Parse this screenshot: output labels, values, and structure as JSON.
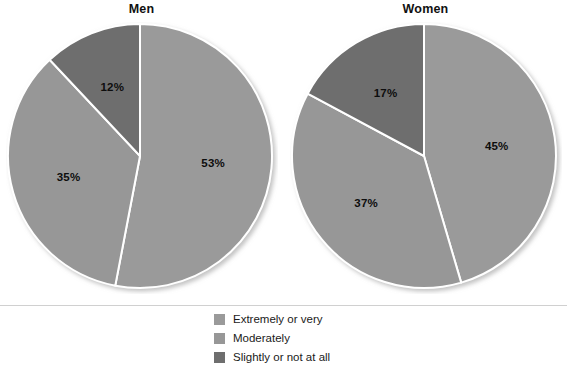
{
  "chart_data": {
    "type": "pie",
    "title": "",
    "subtitle": "",
    "panels": [
      {
        "title": "Men",
        "categories": [
          "Extremely or very",
          "Moderately",
          "Slightly or not at all"
        ],
        "values": [
          53,
          35,
          12
        ],
        "labels": [
          "53%",
          "35%",
          "12%"
        ]
      },
      {
        "title": "Women",
        "categories": [
          "Extremely or very",
          "Moderately",
          "Slightly or not at all"
        ],
        "values": [
          45,
          37,
          17
        ],
        "labels": [
          "45%",
          "37%",
          "17%"
        ]
      }
    ],
    "legend": {
      "position": "bottom-center",
      "entries": [
        {
          "label": "Extremely or very",
          "color": "#9a9a9a"
        },
        {
          "label": "Moderately",
          "color": "#979797"
        },
        {
          "label": "Slightly or not at all",
          "color": "#6e6e6e"
        }
      ]
    },
    "colors": {
      "extremely_or_very": "#9a9a9a",
      "moderately": "#979797",
      "slightly_or_not_at_all": "#6e6e6e",
      "slice_divider": "#ffffff",
      "background": "#ffffff",
      "label_text": "#0d0d0d"
    },
    "start_angle_deg": 0,
    "direction": "clockwise",
    "grid": false,
    "xlabel": "",
    "ylabel": ""
  }
}
